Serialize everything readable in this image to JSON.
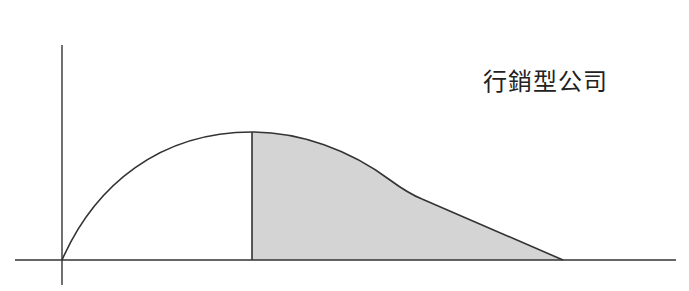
{
  "diagram": {
    "title_label": "行銷型公司",
    "colors": {
      "line": "#333333",
      "fill": "#d4d4d4",
      "background": "#ffffff"
    },
    "axes": {
      "x_axis": {
        "from": [
          15,
          260
        ],
        "to": [
          676,
          260
        ]
      },
      "y_axis": {
        "from": [
          62,
          45
        ],
        "to": [
          62,
          285
        ]
      },
      "origin": [
        62,
        260
      ]
    },
    "curve": {
      "start": [
        62,
        260
      ],
      "peak": [
        252,
        132
      ],
      "kink": [
        422,
        199
      ],
      "end": [
        563,
        260
      ]
    },
    "shaded_region": {
      "from_x": 252,
      "to_x": 563,
      "description": "area under curve after peak"
    },
    "divider_line": {
      "x": 252,
      "from_y": 132,
      "to_y": 260
    }
  }
}
